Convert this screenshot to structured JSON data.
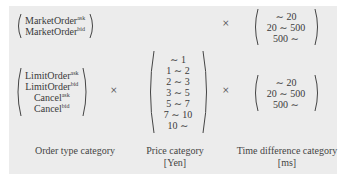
{
  "colors": {
    "background": "#ececec",
    "border": "#ffffff",
    "text": "#3a3a3a"
  },
  "operator": "×",
  "row1": {
    "order_types": [
      {
        "base": "MarketOrder",
        "sup": "ask"
      },
      {
        "base": "MarketOrder",
        "sup": "bid"
      }
    ],
    "time_categories": [
      "∼ 20",
      "20 ∼ 500",
      "500 ∼"
    ]
  },
  "row2": {
    "order_types": [
      {
        "base": "LimitOrder",
        "sup": "ask"
      },
      {
        "base": "LimitOrder",
        "sup": "bid"
      },
      {
        "base": "Cancel",
        "sup": "ask"
      },
      {
        "base": "Cancel",
        "sup": "bid"
      }
    ],
    "price_categories": [
      "∼ 1",
      "1 ∼ 2",
      "2 ∼ 3",
      "3 ∼ 5",
      "5 ∼ 7",
      "7 ∼ 10",
      "10 ∼"
    ],
    "time_categories": [
      "∼ 20",
      "20 ∼ 500",
      "500 ∼"
    ]
  },
  "labels": {
    "order_type": "Order type category",
    "price": "Price category",
    "price_unit": "[Yen]",
    "time": "Time difference category",
    "time_unit": "[ms]"
  }
}
